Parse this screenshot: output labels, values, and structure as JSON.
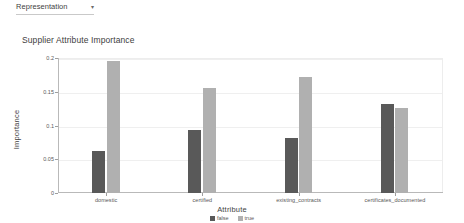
{
  "toolbar": {
    "dropdown": {
      "label": "Representation",
      "caret": "caret-down-icon",
      "caret_glyph": "▾"
    }
  },
  "chart_data": {
    "type": "bar",
    "title": "Supplier Attribute Importance",
    "xlabel": "Attribute",
    "ylabel": "Importance",
    "categories": [
      "domestic",
      "certified",
      "existing_contracts",
      "certificates_documented"
    ],
    "series": [
      {
        "name": "false",
        "color": "#595959",
        "values": [
          0.062,
          0.094,
          0.082,
          0.132
        ]
      },
      {
        "name": "true",
        "color": "#b0b0b0",
        "values": [
          0.195,
          0.156,
          0.172,
          0.126
        ]
      }
    ],
    "ylim": [
      0,
      0.2
    ],
    "yticks": [
      "0",
      "0.05",
      "0.1",
      "0.15",
      "0.2"
    ],
    "ytick_values": [
      0,
      0.05,
      0.1,
      0.15,
      0.2
    ],
    "grid": true,
    "legend_position": "bottom-center"
  }
}
